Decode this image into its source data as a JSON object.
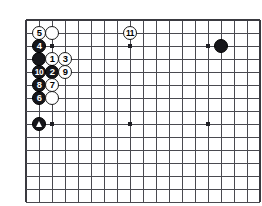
{
  "diagram": {
    "kind": "go-board-diagram",
    "board": {
      "cols": 18,
      "rows": 14,
      "grid_spacing_px": 13,
      "origin_x_px": 26,
      "origin_y_px": 20,
      "line_color": "#4a4a50",
      "edge_color": "#3a3a40",
      "background_color": "#ffffff",
      "cropped_bottom": true,
      "cropped_right": true,
      "star_points": [
        {
          "col": 2,
          "row": 2
        },
        {
          "col": 8,
          "row": 2
        },
        {
          "col": 14,
          "row": 2
        },
        {
          "col": 2,
          "row": 8
        },
        {
          "col": 8,
          "row": 8
        },
        {
          "col": 14,
          "row": 8
        }
      ]
    },
    "colors": {
      "black_stone": "#16161a",
      "white_stone": "#ffffff",
      "stone_outline": "#1a1a1a",
      "black_label_text": "#ffffff",
      "white_label_text": "#000000"
    },
    "stones": [
      {
        "id": "w-unnumbered-top",
        "col": 2,
        "row": 1,
        "color": "white",
        "label": "",
        "marker": "none"
      },
      {
        "id": "m5",
        "col": 1,
        "row": 1,
        "color": "white",
        "label": "5",
        "marker": "none"
      },
      {
        "id": "m4",
        "col": 1,
        "row": 2,
        "color": "black",
        "label": "4",
        "marker": "none"
      },
      {
        "id": "b-unnumbered-a",
        "col": 1,
        "row": 3,
        "color": "black",
        "label": "",
        "marker": "none"
      },
      {
        "id": "m1",
        "col": 2,
        "row": 3,
        "color": "white",
        "label": "1",
        "marker": "none"
      },
      {
        "id": "m3",
        "col": 3,
        "row": 3,
        "color": "white",
        "label": "3",
        "marker": "none"
      },
      {
        "id": "m10",
        "col": 1,
        "row": 4,
        "color": "black",
        "label": "10",
        "marker": "none"
      },
      {
        "id": "m2",
        "col": 2,
        "row": 4,
        "color": "black",
        "label": "2",
        "marker": "none"
      },
      {
        "id": "m9",
        "col": 3,
        "row": 4,
        "color": "white",
        "label": "9",
        "marker": "none"
      },
      {
        "id": "m8",
        "col": 1,
        "row": 5,
        "color": "black",
        "label": "8",
        "marker": "none"
      },
      {
        "id": "m7",
        "col": 2,
        "row": 5,
        "color": "white",
        "label": "7",
        "marker": "none"
      },
      {
        "id": "m6",
        "col": 1,
        "row": 6,
        "color": "black",
        "label": "6",
        "marker": "none"
      },
      {
        "id": "w-unnumbered-b",
        "col": 2,
        "row": 6,
        "color": "white",
        "label": "",
        "marker": "none"
      },
      {
        "id": "b-triangle",
        "col": 1,
        "row": 8,
        "color": "black",
        "label": "",
        "marker": "triangle"
      },
      {
        "id": "m11",
        "col": 8,
        "row": 1,
        "color": "white",
        "label": "11",
        "marker": "none"
      },
      {
        "id": "b-corner-right",
        "col": 15,
        "row": 2,
        "color": "black",
        "label": "",
        "marker": "none"
      }
    ],
    "move_order": [
      "1",
      "2",
      "3",
      "4",
      "5",
      "6",
      "7",
      "8",
      "9",
      "10",
      "11"
    ],
    "legend": {
      "triangle_meaning": "marked black stone",
      "numbered_meaning": "move order"
    }
  }
}
